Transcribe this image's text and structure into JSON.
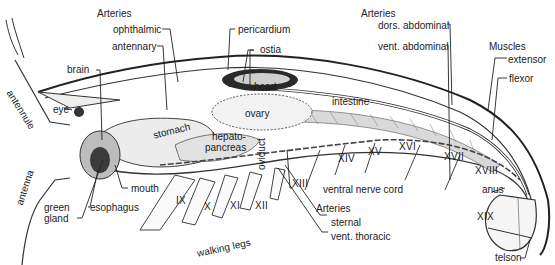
{
  "figure": {
    "groups": {
      "arteries_top_left": "Arteries",
      "arteries_top_right": "Arteries",
      "muscles": "Muscles",
      "arteries_bottom": "Arteries"
    },
    "labels": {
      "ophthalmic": "ophthalmic",
      "antennary": "antennary",
      "pericardium": "pericardium",
      "ostia": "ostia",
      "heart": "heart",
      "ovary": "ovary",
      "intestine": "intestine",
      "dors_abdominal": "dors. abdominal",
      "vent_abdominal": "vent. abdominal",
      "extensor": "extensor",
      "flexor": "flexor",
      "brain": "brain",
      "eye": "eye",
      "antennule": "antennule",
      "antenna": "antenna",
      "stomach": "stomach",
      "hepato": "hepato-",
      "pancreas": "pancreas",
      "oviduct": "oviduct",
      "mouth": "mouth",
      "green": "green",
      "gland": "gland",
      "esophagus": "esophagus",
      "walking_legs": "walking legs",
      "ventral_nerve_cord": "ventral nerve cord",
      "sternal": "sternal",
      "vent_thoracic": "vent. thoracic",
      "anus": "anus",
      "telson": "telson"
    },
    "segments": [
      "IX",
      "X",
      "XI",
      "XII",
      "XIII",
      "XIV",
      "XV",
      "XVI",
      "XVII",
      "XVIII",
      "XIX"
    ]
  }
}
